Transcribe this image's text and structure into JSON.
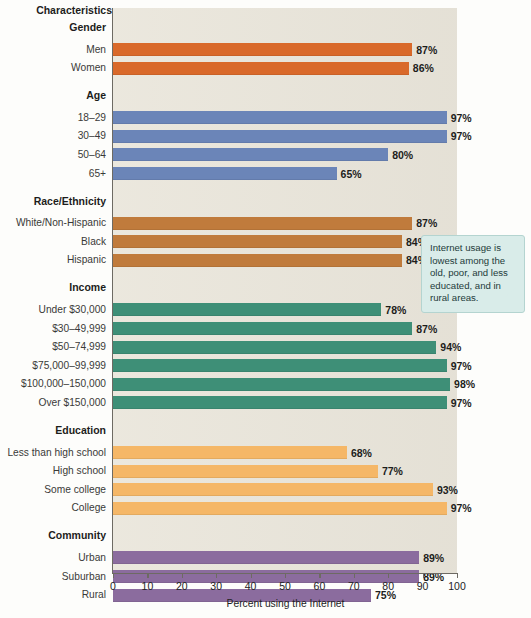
{
  "chart_data": {
    "type": "bar",
    "orientation": "horizontal",
    "title": "",
    "xlabel": "Percent using the Internet",
    "ylabel": "Characteristics",
    "xlim": [
      0,
      100
    ],
    "xticks": [
      0,
      10,
      20,
      30,
      40,
      50,
      60,
      70,
      80,
      90,
      100
    ],
    "grid": false,
    "legend": "none",
    "value_suffix": "%",
    "groups": [
      {
        "name": "Gender",
        "color": "#d9692a",
        "categories": [
          "Men",
          "Women"
        ],
        "values": [
          87,
          86
        ],
        "value_labels": [
          "87%",
          "86%"
        ]
      },
      {
        "name": "Age",
        "color": "#6b85b8",
        "categories": [
          "18–29",
          "30–49",
          "50–64",
          "65+"
        ],
        "values": [
          97,
          97,
          80,
          65
        ],
        "value_labels": [
          "97%",
          "97%",
          "80%",
          "65%"
        ]
      },
      {
        "name": "Race/Ethnicity",
        "color": "#c07b3c",
        "categories": [
          "White/Non-Hispanic",
          "Black",
          "Hispanic"
        ],
        "values": [
          87,
          84,
          84
        ],
        "value_labels": [
          "87%",
          "84%",
          "84%"
        ]
      },
      {
        "name": "Income",
        "color": "#3e8f77",
        "categories": [
          "Under $30,000",
          "$30–49,999",
          "$50–74,999",
          "$75,000–99,999",
          "$100,000–150,000",
          "Over $150,000"
        ],
        "values": [
          78,
          87,
          94,
          97,
          98,
          97
        ],
        "value_labels": [
          "78%",
          "87%",
          "94%",
          "97%",
          "98%",
          "97%"
        ]
      },
      {
        "name": "Education",
        "color": "#f5b767",
        "categories": [
          "Less than high school",
          "High school",
          "Some college",
          "College"
        ],
        "values": [
          68,
          77,
          93,
          97
        ],
        "value_labels": [
          "68%",
          "77%",
          "93%",
          "97%"
        ]
      },
      {
        "name": "Community",
        "color": "#8b6c9e",
        "categories": [
          "Urban",
          "Suburban",
          "Rural"
        ],
        "values": [
          89,
          89,
          75
        ],
        "value_labels": [
          "89%",
          "89%",
          "75%"
        ]
      }
    ]
  },
  "header": {
    "characteristics_label": "Characteristics"
  },
  "axis": {
    "x_title": "Percent using the Internet",
    "tick_labels": [
      "0",
      "10",
      "20",
      "30",
      "40",
      "50",
      "60",
      "70",
      "80",
      "90",
      "100"
    ]
  },
  "callout": {
    "text": "Internet usage is lowest among the old, poor, and less educated, and in rural areas.",
    "background": "#d9ece9",
    "border": "#b4d4d0"
  },
  "colors": {
    "plot_background": "#e9e5da",
    "axis": "#6d6a63",
    "text": "#1d1d1b"
  }
}
